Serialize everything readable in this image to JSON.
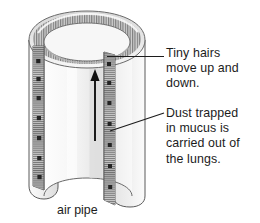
{
  "figure": {
    "background_color": "#ffffff"
  },
  "diagram": {
    "flow_arrow": {
      "name": "upward-flow-arrow",
      "direction": "up",
      "color": "#111111"
    },
    "colors": {
      "outer_wall": "#e9e9e9",
      "inner_wall": "#f4f4f4",
      "rim_shadow": "#c9c9c9",
      "cilia_band": "#b9b9b9",
      "outline": "#4a4a4a",
      "dust_speck": "#2a2a2a",
      "leader_line": "#1c1c1c",
      "text": "#1c1c1c"
    }
  },
  "labels": {
    "cilia": "Tiny hairs\nmove up and\ndown.",
    "mucus": "Dust trapped\nin mucus is\ncarried out of\nthe lungs.",
    "caption": "air pipe"
  },
  "leaders": [
    {
      "name": "leader-line-cilia",
      "style": "horizontal"
    },
    {
      "name": "leader-line-mucus",
      "style": "diagonal"
    }
  ]
}
